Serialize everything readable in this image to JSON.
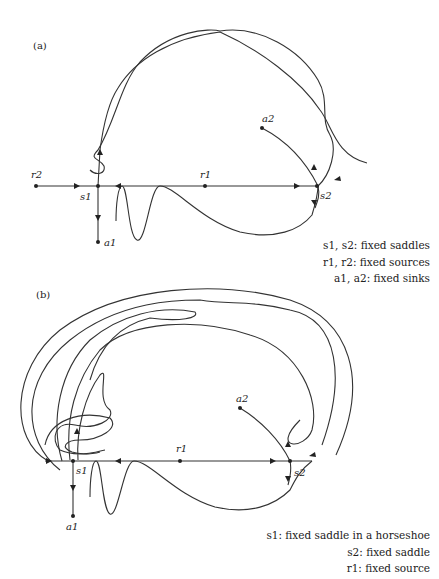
{
  "panels": [
    {
      "label": "(a)",
      "points": {
        "r2": "r2",
        "s1": "s1",
        "a1": "a1",
        "r1": "r1",
        "a2": "a2",
        "s2": "s2"
      },
      "legend": [
        "s1, s2: fixed saddles",
        "r1, r2: fixed sources",
        "a1, a2: fixed sinks"
      ]
    },
    {
      "label": "(b)",
      "points": {
        "s1": "s1",
        "a1": "a1",
        "r1": "r1",
        "a2": "a2",
        "s2": "s2"
      },
      "legend": [
        "s1: fixed saddle in a horseshoe",
        "s2: fixed saddle",
        "r1: fixed source"
      ]
    }
  ],
  "colors": {
    "line": "#333333",
    "background": "#ffffff"
  }
}
